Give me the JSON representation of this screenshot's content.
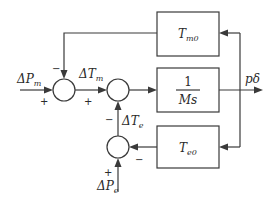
{
  "diagram": {
    "type": "control-block-diagram",
    "blocks": {
      "tm0": {
        "symbol": "T",
        "subscript": "m0"
      },
      "integrator": {
        "numerator": "1",
        "denominator": "Ms"
      },
      "te0": {
        "symbol": "T",
        "subscript": "e0"
      }
    },
    "inputs": {
      "dpm": {
        "delta": "Δ",
        "symbol": "P",
        "subscript": "m"
      },
      "dpe": {
        "delta": "Δ",
        "symbol": "P",
        "subscript": "e"
      }
    },
    "signals": {
      "dtm": {
        "delta": "Δ",
        "symbol": "T",
        "subscript": "m"
      },
      "dte": {
        "delta": "Δ",
        "symbol": "T",
        "subscript": "e"
      }
    },
    "output": {
      "label": "pδ"
    },
    "signs": {
      "sum1_left": "+",
      "sum1_top": "−",
      "sum2_left": "+",
      "sum2_bottom": "−",
      "sum3_bottom": "+",
      "sum3_right": "−"
    }
  }
}
